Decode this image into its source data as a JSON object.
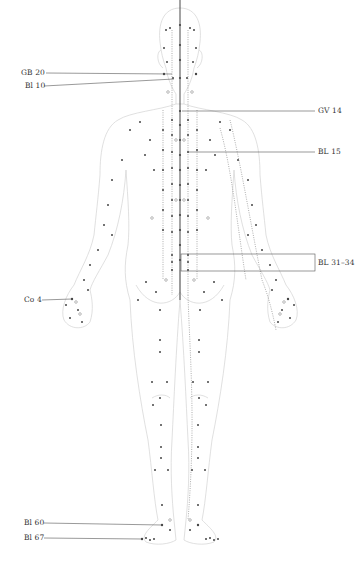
{
  "diagram": {
    "colors": {
      "outline": "#cfcfcf",
      "point": "#444444",
      "line": "#666666",
      "meridian": "#777777"
    },
    "labels_left": [
      {
        "id": "gb20",
        "text": "GB 20",
        "x": 22,
        "y": 72,
        "line_to": [
          172,
          74
        ]
      },
      {
        "id": "bl10",
        "text": "Bl 10",
        "x": 25,
        "y": 85,
        "line_to": [
          172,
          78
        ]
      },
      {
        "id": "co4",
        "text": "Co 4",
        "x": 24,
        "y": 299,
        "line_to": [
          72,
          299
        ]
      },
      {
        "id": "bl60",
        "text": "Bl 60",
        "x": 24,
        "y": 522,
        "line_to": [
          162,
          525
        ]
      },
      {
        "id": "bl67",
        "text": "Bl 67",
        "x": 24,
        "y": 537,
        "line_to": [
          142,
          539
        ]
      }
    ],
    "labels_right": [
      {
        "id": "gv14",
        "text": "GV 14",
        "x": 318,
        "y": 109,
        "line_from": [
          182,
          111
        ]
      },
      {
        "id": "bl15",
        "text": "BL 15",
        "x": 318,
        "y": 149,
        "line_from": [
          188,
          152
        ]
      },
      {
        "id": "bl31_34",
        "text": "BL 31–34",
        "x": 318,
        "y": 263,
        "box": [
          181,
          254,
          134,
          17
        ]
      }
    ]
  }
}
